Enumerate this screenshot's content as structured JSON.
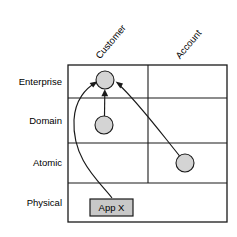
{
  "diagram": {
    "type": "matrix-diagram",
    "width": 237,
    "height": 237,
    "row_axis_title": "",
    "column_axis_title": "",
    "rows": [
      {
        "id": "enterprise",
        "label": "Enterprise",
        "y_center": 81.5,
        "y_top": 65,
        "y_bottom": 98
      },
      {
        "id": "domain",
        "label": "Domain",
        "y_center": 120.5,
        "y_top": 98,
        "y_bottom": 143
      },
      {
        "id": "atomic",
        "label": "Atomic",
        "y_center": 163,
        "y_top": 143,
        "y_bottom": 183
      },
      {
        "id": "physical",
        "label": "Physical",
        "y_center": 202.5,
        "y_top": 183,
        "y_bottom": 222
      }
    ],
    "columns": [
      {
        "id": "customer",
        "label": "Customer",
        "x_center": 108,
        "x_left": 68,
        "x_right": 148
      },
      {
        "id": "account",
        "label": "Account",
        "x_center": 187.5,
        "x_left": 148,
        "x_right": 227
      }
    ],
    "grid": {
      "x_left": 68,
      "x_right": 227,
      "y_top": 65,
      "y_bottom": 222,
      "horizontal_dividers": [
        98,
        143,
        183
      ],
      "vertical_dividers": [
        148
      ],
      "vertical_divider_y_start": 65,
      "vertical_divider_y_end": 183,
      "outer_border_color": "#1a1a1a",
      "line_color": "#1a1a1a"
    },
    "header_rotation_degrees": -50,
    "nodes": [
      {
        "id": "customer-enterprise",
        "shape": "circle",
        "label": "",
        "row": "enterprise",
        "column": "customer",
        "cx": 105,
        "cy": 80,
        "r": 9,
        "fill": "#d4d4d4",
        "stroke": "#1a1a1a"
      },
      {
        "id": "customer-domain",
        "shape": "circle",
        "label": "",
        "row": "domain",
        "column": "customer",
        "cx": 104,
        "cy": 125,
        "r": 9,
        "fill": "#d4d4d4",
        "stroke": "#1a1a1a"
      },
      {
        "id": "account-atomic",
        "shape": "circle",
        "label": "",
        "row": "atomic",
        "column": "account",
        "cx": 185,
        "cy": 163,
        "r": 9,
        "fill": "#d4d4d4",
        "stroke": "#1a1a1a"
      },
      {
        "id": "app-x",
        "shape": "rect",
        "label": "App X",
        "row": "physical",
        "column": "customer",
        "x": 90,
        "y": 199,
        "width": 43,
        "height": 17,
        "fill": "#c8c8c8",
        "stroke": "#1a1a1a"
      }
    ],
    "arrows": [
      {
        "id": "arrow-appx-to-customer-enterprise",
        "from": "app-x",
        "to": "customer-enterprise",
        "style": "curved",
        "direction": "up-left-bow",
        "path": "M 112 198 C 100 182, 72 160, 74 120 C 75 100, 86 88, 95 83",
        "head_x": 97.5,
        "head_y": 81.5,
        "head_angle": -28
      },
      {
        "id": "arrow-customer-domain-to-customer-enterprise",
        "from": "customer-domain",
        "to": "customer-enterprise",
        "style": "straight",
        "direction": "up",
        "path": "M 104.5 116 L 104.8 93",
        "head_x": 104.8,
        "head_y": 89.5,
        "head_angle": 90
      },
      {
        "id": "arrow-account-atomic-to-customer-enterprise",
        "from": "account-atomic",
        "to": "customer-enterprise",
        "style": "slightly-curved",
        "direction": "up-left",
        "path": "M 179 155.5 C 160 132, 136 100, 119 84",
        "head_x": 115.5,
        "head_y": 81.2,
        "head_angle": 208
      }
    ]
  }
}
